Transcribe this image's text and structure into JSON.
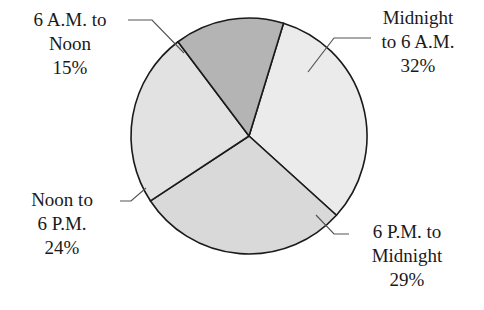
{
  "chart_data": {
    "type": "pie",
    "title": "",
    "categories": [
      "Midnight to 6 A.M.",
      "6 P.M. to Midnight",
      "Noon to 6 P.M.",
      "6 A.M. to Noon"
    ],
    "values": [
      32,
      29,
      24,
      15
    ],
    "unit": "%",
    "colors": [
      "#ebebeb",
      "#d9d9d9",
      "#e2e2e2",
      "#b4b4b4"
    ],
    "labels": [
      {
        "line1": "Midnight",
        "line2": "to 6 A.M.",
        "pct": "32%"
      },
      {
        "line1": "6 P.M. to",
        "line2": "Midnight",
        "pct": "29%"
      },
      {
        "line1": "Noon to",
        "line2": "6 P.M.",
        "pct": "24%"
      },
      {
        "line1": "6 A.M. to",
        "line2": "Noon",
        "pct": "15%"
      }
    ],
    "legend": "none (callout labels with leader lines)"
  }
}
